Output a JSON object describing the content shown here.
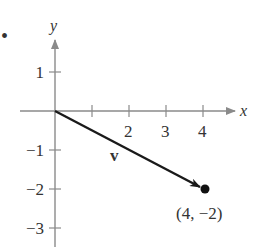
{
  "figure": {
    "bullet": "•",
    "axes": {
      "x_label": "x",
      "y_label": "y",
      "x_ticks": [
        {
          "value": 1,
          "label": ""
        },
        {
          "value": 2,
          "label": "2"
        },
        {
          "value": 3,
          "label": "3"
        },
        {
          "value": 4,
          "label": "4"
        }
      ],
      "y_ticks": [
        {
          "value": 1,
          "label": "1"
        },
        {
          "value": -1,
          "label": "−1"
        },
        {
          "value": -2,
          "label": "−2"
        },
        {
          "value": -3,
          "label": "−3"
        }
      ]
    },
    "vector": {
      "name": "v",
      "start": [
        0,
        0
      ],
      "end": [
        4,
        -2
      ],
      "end_label": "(4, −2)"
    },
    "colors": {
      "axis": "#8a8a8a",
      "vector": "#1a1a1a",
      "text": "#333333"
    }
  }
}
